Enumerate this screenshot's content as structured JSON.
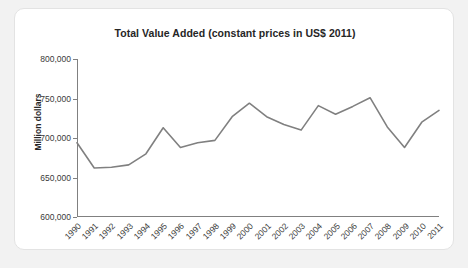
{
  "chart_data": {
    "type": "line",
    "title": "Total Value Added (constant prices in US$ 2011)",
    "xlabel": "",
    "ylabel": "Million dollars",
    "ylim": [
      600000,
      800000
    ],
    "yticks": [
      "600,000",
      "650,000",
      "700,000",
      "750,000",
      "800,000"
    ],
    "ytick_values": [
      600000,
      650000,
      700000,
      750000,
      800000
    ],
    "grid": false,
    "legend": "none",
    "line_color": "#808080",
    "categories": [
      "1990",
      "1991",
      "1992",
      "1993",
      "1994",
      "1995",
      "1996",
      "1997",
      "1998",
      "1999",
      "2000",
      "2001",
      "2002",
      "2003",
      "2004",
      "2005",
      "2006",
      "2007",
      "2008",
      "2009",
      "2010",
      "2011"
    ],
    "values": [
      694000,
      662000,
      663000,
      666000,
      680000,
      713000,
      688000,
      694000,
      697000,
      727000,
      744000,
      727000,
      717000,
      710000,
      741000,
      730000,
      740000,
      751000,
      714000,
      688000,
      720000,
      735000
    ]
  }
}
